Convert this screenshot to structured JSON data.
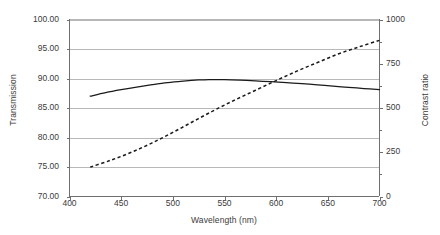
{
  "chart_data": {
    "type": "line",
    "title": "",
    "xlabel": "Wavelength (nm)",
    "ylabel": "Transmission",
    "y2label": "Contrast ratio",
    "xlim": [
      400,
      700
    ],
    "ylim": [
      70.0,
      100.0
    ],
    "y2lim": [
      0,
      1000
    ],
    "grid": true,
    "grid_axis": "y",
    "legend": "none",
    "xticks": [
      400,
      450,
      500,
      550,
      600,
      650,
      700
    ],
    "xticklabels": [
      "400",
      "450",
      "500",
      "550",
      "600",
      "650",
      "700"
    ],
    "yticks": [
      70.0,
      75.0,
      80.0,
      85.0,
      90.0,
      95.0,
      100.0
    ],
    "yticklabels": [
      "70.00",
      "75.00",
      "80.00",
      "85.00",
      "90.00",
      "95.00",
      "100.00"
    ],
    "y2ticks": [
      0,
      250,
      500,
      750,
      1000
    ],
    "y2ticklabels": [
      "0",
      "250",
      "500",
      "750",
      "1000"
    ],
    "y2minorticks": [
      125,
      375,
      625,
      875
    ],
    "series": [
      {
        "name": "Transmission",
        "axis": "left",
        "style": "solid",
        "color": "#1a1a1a",
        "x": [
          420,
          435,
          450,
          465,
          480,
          495,
          510,
          525,
          535,
          550,
          565,
          580,
          595,
          610,
          625,
          640,
          655,
          670,
          685,
          700
        ],
        "values": [
          87.0,
          87.6,
          88.1,
          88.55,
          88.95,
          89.3,
          89.55,
          89.75,
          89.82,
          89.8,
          89.72,
          89.6,
          89.45,
          89.3,
          89.12,
          88.93,
          88.72,
          88.5,
          88.3,
          88.1
        ]
      },
      {
        "name": "Contrast ratio",
        "axis": "right",
        "style": "dashed",
        "color": "#1a1a1a",
        "x": [
          420,
          440,
          460,
          480,
          500,
          520,
          540,
          560,
          580,
          600,
          620,
          640,
          660,
          680,
          700
        ],
        "values": [
          166,
          205,
          250,
          303,
          362,
          425,
          487,
          545,
          600,
          655,
          708,
          757,
          805,
          845,
          882
        ]
      }
    ]
  }
}
